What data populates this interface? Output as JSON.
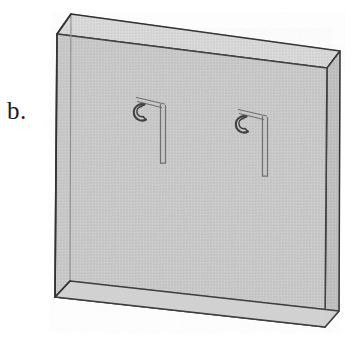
{
  "figure": {
    "label": "b.",
    "caption_text": "b.",
    "kind": "technical-line-drawing",
    "background_color": "#ffffff",
    "outline_color": "#3a3a3a",
    "outline_color_dark": "#2b2b2b",
    "face_fill": "#c9c9c9",
    "top_face_fill": "#d8d8d8",
    "side_face_fill": "#bdbdbd",
    "inner_face_fill": "#c4c4c4",
    "hook_stroke": "#6e6e6e",
    "hook_stroke_dark": "#3d3d3d"
  },
  "panel": {
    "name": "rectangular-slab",
    "description": "Isometric view of a flat rectangular panel drawn with visible thickness; front face, top face and right side face are shaded; hidden back edges are faintly drawn showing a translucent body.",
    "geometry": {
      "front_top_left": [
        57,
        34
      ],
      "front_top_right": [
        327,
        68
      ],
      "front_bottom_right": [
        325,
        327
      ],
      "front_bottom_left": [
        55,
        297
      ],
      "back_top_left": [
        71,
        14
      ],
      "back_top_right": [
        340,
        51
      ],
      "back_bottom_right": [
        339,
        311
      ],
      "back_bottom_left": [
        70,
        281
      ]
    },
    "thickness_px": 24,
    "units": "pixels"
  },
  "hooks": [
    {
      "id": "hook-1",
      "name": "embedded-hook-anchor-left",
      "description": "Vertical double-line stem with diagonal strut rising to a small C-shaped lifting eye",
      "stem_top": [
        163,
        104
      ],
      "stem_bottom": [
        163,
        163
      ],
      "strut_end": [
        137,
        99
      ],
      "eye_center": [
        139,
        112
      ],
      "eye_radius": 7
    },
    {
      "id": "hook-2",
      "name": "embedded-hook-anchor-right",
      "description": "Vertical double-line stem with diagonal strut rising to a small C-shaped lifting eye",
      "stem_top": [
        265,
        116
      ],
      "stem_bottom": [
        265,
        176
      ],
      "strut_end": [
        239,
        111
      ],
      "eye_center": [
        241,
        124
      ],
      "eye_radius": 7
    }
  ]
}
